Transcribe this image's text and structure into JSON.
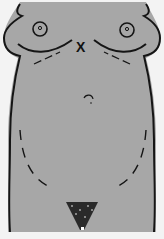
{
  "diagram": {
    "marker": {
      "label": "X",
      "x": 82,
      "y": 47
    },
    "colors": {
      "background": "#f3f3f3",
      "skin": "#a7a7a7",
      "outline": "#151515"
    }
  }
}
